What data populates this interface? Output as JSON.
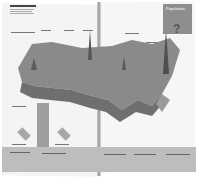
{
  "image": {
    "subject": "Open magazine spread with 3D population relief map of the United States",
    "infobox": {
      "title_lines": [
        "Population",
        "Data Guide"
      ],
      "glyph": "?"
    },
    "colors": {
      "page": "#f4f4f4",
      "map": "#8a8a8a",
      "infobox": "#8e8e8e",
      "footer": "#bdbdbd"
    }
  }
}
